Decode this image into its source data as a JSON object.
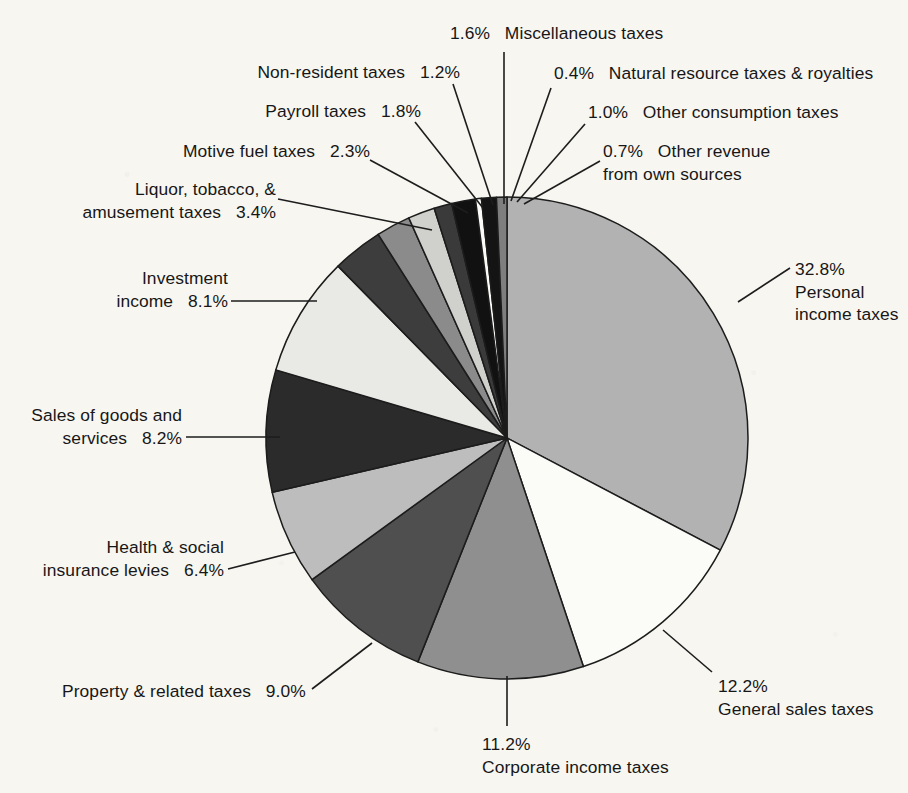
{
  "chart_data": {
    "type": "pie",
    "title": "",
    "subtitle": "",
    "xlabel": "",
    "ylabel": "",
    "legend_position": "callout-labels",
    "grid": false,
    "units": "percent",
    "start_angle_deg": 0,
    "direction": "clockwise",
    "categories": [
      "Personal income taxes",
      "General sales taxes",
      "Corporate income taxes",
      "Property & related taxes",
      "Health & social insurance levies",
      "Sales of goods and services",
      "Investment income",
      "Liquor, tobacco, & amusement taxes",
      "Motive fuel taxes",
      "Payroll taxes",
      "Non-resident taxes",
      "Miscellaneous taxes",
      "Natural resource taxes & royalties",
      "Other consumption taxes",
      "Other revenue from own sources"
    ],
    "values": [
      32.8,
      12.2,
      11.2,
      9.0,
      6.4,
      8.2,
      8.1,
      3.4,
      2.3,
      1.8,
      1.2,
      1.6,
      0.4,
      1.0,
      0.7
    ],
    "colors": [
      "#b2b2b2",
      "#fbfbf8",
      "#8f8f8f",
      "#4f4f4f",
      "#bdbdbd",
      "#2b2b2b",
      "#e9e9e5",
      "#3d3d3d",
      "#8b8b8b",
      "#d0d0cc",
      "#3a3a3a",
      "#111111",
      "#fbfbf8",
      "#141414",
      "#7e7e7e"
    ],
    "slices": [
      {
        "label": "Personal income taxes",
        "pct_text": "32.8%",
        "value": 32.8,
        "color": "#b2b2b2"
      },
      {
        "label": "General sales taxes",
        "pct_text": "12.2%",
        "value": 12.2,
        "color": "#fbfbf8"
      },
      {
        "label": "Corporate income taxes",
        "pct_text": "11.2%",
        "value": 11.2,
        "color": "#8f8f8f"
      },
      {
        "label": "Property & related taxes",
        "pct_text": "9.0%",
        "value": 9.0,
        "color": "#4f4f4f"
      },
      {
        "label": "Health & social insurance levies",
        "pct_text": "6.4%",
        "value": 6.4,
        "color": "#bdbdbd"
      },
      {
        "label": "Sales of goods and services",
        "pct_text": "8.2%",
        "value": 8.2,
        "color": "#2b2b2b"
      },
      {
        "label": "Investment income",
        "pct_text": "8.1%",
        "value": 8.1,
        "color": "#e9e9e5"
      },
      {
        "label": "Liquor, tobacco, & amusement taxes",
        "pct_text": "3.4%",
        "value": 3.4,
        "color": "#3d3d3d"
      },
      {
        "label": "Motive fuel taxes",
        "pct_text": "2.3%",
        "value": 2.3,
        "color": "#8b8b8b"
      },
      {
        "label": "Payroll taxes",
        "pct_text": "1.8%",
        "value": 1.8,
        "color": "#d0d0cc"
      },
      {
        "label": "Non-resident taxes",
        "pct_text": "1.2%",
        "value": 1.2,
        "color": "#3a3a3a"
      },
      {
        "label": "Miscellaneous taxes",
        "pct_text": "1.6%",
        "value": 1.6,
        "color": "#111111"
      },
      {
        "label": "Natural resource taxes & royalties",
        "pct_text": "0.4%",
        "value": 0.4,
        "color": "#fbfbf8"
      },
      {
        "label": "Other consumption taxes",
        "pct_text": "1.0%",
        "value": 1.0,
        "color": "#141414"
      },
      {
        "label": "Other revenue from own sources",
        "pct_text": "0.7%",
        "value": 0.7,
        "color": "#7e7e7e"
      }
    ]
  },
  "labels": {
    "miscellaneous": {
      "pct": "1.6%",
      "name": "Miscellaneous taxes"
    },
    "natural_resource": {
      "pct": "0.4%",
      "name": "Natural resource taxes & royalties"
    },
    "other_consumption": {
      "pct": "1.0%",
      "name": "Other consumption taxes"
    },
    "other_revenue": {
      "pct": "0.7%",
      "name": "Other revenue",
      "name2": "from own sources"
    },
    "non_resident": {
      "pct": "1.2%",
      "name": "Non-resident taxes"
    },
    "payroll": {
      "pct": "1.8%",
      "name": "Payroll taxes"
    },
    "motive_fuel": {
      "pct": "2.3%",
      "name": "Motive fuel taxes"
    },
    "liquor": {
      "pct": "3.4%",
      "name": "Liquor, tobacco, &",
      "name2": "amusement taxes"
    },
    "investment": {
      "pct": "8.1%",
      "name": "Investment",
      "name2": "income"
    },
    "sales_goods": {
      "pct": "8.2%",
      "name": "Sales of goods and",
      "name2": "services"
    },
    "health_social": {
      "pct": "6.4%",
      "name": "Health & social",
      "name2": "insurance levies"
    },
    "property": {
      "pct": "9.0%",
      "name": "Property & related taxes"
    },
    "corporate": {
      "pct": "11.2%",
      "name": "Corporate income taxes"
    },
    "general_sales": {
      "pct": "12.2%",
      "name": "General sales taxes"
    },
    "personal": {
      "pct": "32.8%",
      "name": "Personal",
      "name2": "income taxes"
    }
  },
  "style": {
    "background": "#f7f6f1",
    "ink": "#171717",
    "slice_outline": "#1c1c1c"
  }
}
